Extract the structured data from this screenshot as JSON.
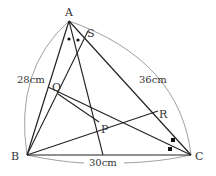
{
  "diagram": {
    "type": "triangle-geometry",
    "points": {
      "A": {
        "label": "A",
        "x": 69,
        "y": 21
      },
      "B": {
        "label": "B",
        "x": 27,
        "y": 155
      },
      "C": {
        "label": "C",
        "x": 191,
        "y": 155
      },
      "S": {
        "label": "S",
        "x": 88,
        "y": 31
      },
      "Q": {
        "label": "Q",
        "x": 58,
        "y": 94
      },
      "P": {
        "label": "P",
        "x": 99,
        "y": 122
      },
      "R": {
        "label": "R",
        "x": 158,
        "y": 111
      }
    },
    "dimensions": {
      "AB": "28cm",
      "AC": "36cm",
      "BC": "30cm"
    },
    "angle_marks": {
      "A": "two equal angles (dots)",
      "C": "two equal angles (squares)"
    }
  }
}
